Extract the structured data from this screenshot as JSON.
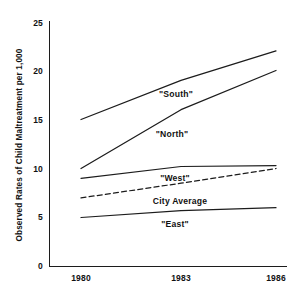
{
  "chart_data": {
    "type": "line",
    "title": "",
    "xlabel": "",
    "ylabel": "Observed Rates of Child Maltreatment per 1,000",
    "x": [
      1980,
      1983,
      1986
    ],
    "categories": [
      "1980",
      "1983",
      "1986"
    ],
    "xtick_labels": [
      "1980",
      "1983",
      "1986"
    ],
    "ytick_labels": [
      "0",
      "5",
      "10",
      "15",
      "20",
      "25"
    ],
    "ytick_values": [
      0,
      5,
      10,
      15,
      20,
      25
    ],
    "ylim": [
      0,
      25
    ],
    "xlim": [
      1979.4,
      1986.9
    ],
    "grid": false,
    "legend": "inline-annotations",
    "series": [
      {
        "name": "\"South\"",
        "label": "\"South\"",
        "style": "solid",
        "color": "#1c1c1c",
        "values": [
          15.0,
          19.0,
          22.0
        ]
      },
      {
        "name": "\"North\"",
        "label": "\"North\"",
        "style": "solid",
        "color": "#1c1c1c",
        "values": [
          10.0,
          16.0,
          20.0
        ]
      },
      {
        "name": "\"West\"",
        "label": "\"West\"",
        "style": "solid",
        "color": "#1c1c1c",
        "values": [
          9.0,
          10.2,
          10.3
        ]
      },
      {
        "name": "City Average",
        "label": "City Average",
        "style": "dashed",
        "color": "#1c1c1c",
        "values": [
          7.0,
          8.5,
          10.0
        ]
      },
      {
        "name": "\"East\"",
        "label": "\"East\"",
        "style": "solid",
        "color": "#1c1c1c",
        "values": [
          5.0,
          5.7,
          6.0
        ]
      }
    ],
    "annotations": [
      {
        "text": "\"South\"",
        "x": 176,
        "y": 97
      },
      {
        "text": "\"North\"",
        "x": 172,
        "y": 137
      },
      {
        "text": "\"West\"",
        "x": 175,
        "y": 181
      },
      {
        "text": "City Average",
        "x": 180,
        "y": 204
      },
      {
        "text": "\"East\"",
        "x": 175,
        "y": 227
      }
    ]
  },
  "axis": {
    "y_title": "Observed Rates of Child Maltreatment per 1,000",
    "yticks": [
      "25",
      "20",
      "15",
      "10",
      "5",
      "0"
    ],
    "xticks": [
      "1980",
      "1983",
      "1986"
    ]
  }
}
